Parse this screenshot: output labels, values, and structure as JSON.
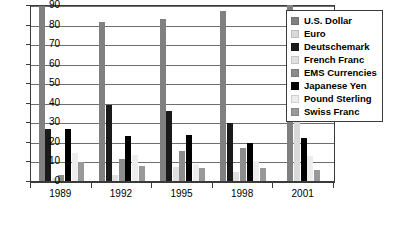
{
  "chart_data": {
    "type": "bar",
    "title": "",
    "xlabel": "",
    "ylabel": "",
    "ylim": [
      0,
      90
    ],
    "yticks": [
      0,
      10,
      20,
      30,
      40,
      50,
      60,
      70,
      80,
      90
    ],
    "grid": true,
    "legend_position": "top-right",
    "categories": [
      "1989",
      "1992",
      "1995",
      "1998",
      "2001"
    ],
    "series": [
      {
        "name": "U.S. Dollar",
        "color": "#808080",
        "values": [
          90.0,
          82.0,
          83.3,
          87.3,
          90.3
        ]
      },
      {
        "name": "Euro",
        "color": "#d9d9d9",
        "values": [
          0,
          0,
          0,
          0,
          37.6
        ]
      },
      {
        "name": "Deutschemark",
        "color": "#1a1a1a",
        "values": [
          27.0,
          39.6,
          36.1,
          30.1,
          0
        ]
      },
      {
        "name": "French Franc",
        "color": "#e0e0e0",
        "values": [
          2.0,
          3.8,
          7.9,
          5.1,
          0
        ]
      },
      {
        "name": "EMS Currencies",
        "color": "#8c8c8c",
        "values": [
          3.5,
          11.8,
          15.7,
          17.3,
          0
        ]
      },
      {
        "name": "Japanese Yen",
        "color": "#000000",
        "values": [
          27.0,
          23.4,
          24.1,
          20.2,
          22.7
        ]
      },
      {
        "name": "Pound Sterling",
        "color": "#ededed",
        "values": [
          15.0,
          13.6,
          9.4,
          11.0,
          13.2
        ]
      },
      {
        "name": "Swiss Franc",
        "color": "#999999",
        "values": [
          10.0,
          8.4,
          7.3,
          7.1,
          6.1
        ]
      }
    ]
  },
  "legend": {
    "items": [
      {
        "label": "U.S. Dollar"
      },
      {
        "label": "Euro"
      },
      {
        "label": "Deutschemark"
      },
      {
        "label": "French Franc"
      },
      {
        "label": "EMS Currencies"
      },
      {
        "label": "Japanese Yen"
      },
      {
        "label": "Pound Sterling"
      },
      {
        "label": "Swiss Franc"
      }
    ]
  }
}
